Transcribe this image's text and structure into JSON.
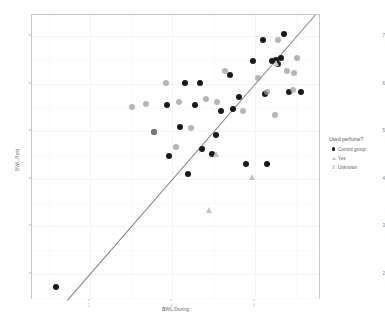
{
  "chart_data": {
    "type": "scatter",
    "title": "",
    "xlabel": "BWL.During",
    "ylabel": "BWL.Post",
    "xlim": [
      0.6,
      7.6
    ],
    "ylim": [
      1.45,
      7.45
    ],
    "xticks": [
      2,
      4,
      6
    ],
    "xticklabels": [
      "2",
      "4",
      "6"
    ],
    "yticks": [
      2,
      3,
      4,
      5,
      6,
      7
    ],
    "yticklabels": [
      "2",
      "3",
      "4",
      "5",
      "6",
      "7"
    ],
    "grid": true,
    "legend_position": "right",
    "reference_line": {
      "type": "identity",
      "slope": 1,
      "intercept": 0,
      "color": "#6a6a6a"
    },
    "series": [
      {
        "name": "Control group",
        "marker": "circle",
        "color": "#1a1a1a",
        "points": [
          [
            1.18,
            1.72
          ],
          [
            3.55,
            4.98
          ],
          [
            4.18,
            5.1
          ],
          [
            3.88,
            5.55
          ],
          [
            4.55,
            5.55
          ],
          [
            4.3,
            6.02
          ],
          [
            4.68,
            6.02
          ],
          [
            5.18,
            5.42
          ],
          [
            5.05,
            4.92
          ],
          [
            5.48,
            5.48
          ],
          [
            5.4,
            6.18
          ],
          [
            5.62,
            5.72
          ],
          [
            5.95,
            6.48
          ],
          [
            6.2,
            6.92
          ],
          [
            6.42,
            6.48
          ],
          [
            6.5,
            6.5
          ],
          [
            6.55,
            6.42
          ],
          [
            6.62,
            6.55
          ],
          [
            6.7,
            7.05
          ],
          [
            6.82,
            5.82
          ],
          [
            7.12,
            5.82
          ],
          [
            6.25,
            5.78
          ],
          [
            5.78,
            4.32
          ],
          [
            6.3,
            4.32
          ],
          [
            4.72,
            4.62
          ],
          [
            3.92,
            4.48
          ],
          [
            4.95,
            4.52
          ],
          [
            4.38,
            4.1
          ]
        ]
      },
      {
        "name": "Yes",
        "marker": "triangle",
        "color": "#c4c4c4",
        "points": [
          [
            5.05,
            4.52
          ],
          [
            4.88,
            3.35
          ],
          [
            5.92,
            4.05
          ],
          [
            6.52,
            6.45
          ]
        ]
      },
      {
        "name": "Unknown",
        "marker": "circle-light",
        "color": "#9a9a9a",
        "points": [
          [
            3.35,
            5.58
          ],
          [
            3.85,
            6.02
          ],
          [
            4.15,
            5.62
          ],
          [
            4.45,
            5.08
          ],
          [
            4.82,
            5.68
          ],
          [
            5.08,
            5.62
          ],
          [
            5.28,
            6.28
          ],
          [
            5.72,
            5.42
          ],
          [
            6.08,
            6.12
          ],
          [
            6.3,
            5.82
          ],
          [
            6.48,
            5.35
          ],
          [
            6.55,
            6.92
          ],
          [
            6.78,
            6.28
          ],
          [
            6.92,
            5.88
          ],
          [
            7.02,
            6.55
          ],
          [
            3.02,
            5.52
          ],
          [
            3.55,
            4.98
          ],
          [
            4.08,
            4.68
          ],
          [
            6.95,
            6.22
          ]
        ]
      }
    ]
  },
  "legend": {
    "title": "Used perfume?",
    "items": [
      {
        "label": "Control group",
        "marker": "circle",
        "color": "#1a1a1a"
      },
      {
        "label": "Yes",
        "marker": "triangle",
        "color": "#c0c0c0"
      },
      {
        "label": "Unknown",
        "marker": "circle-light",
        "color": "#dcdcdc"
      }
    ]
  }
}
